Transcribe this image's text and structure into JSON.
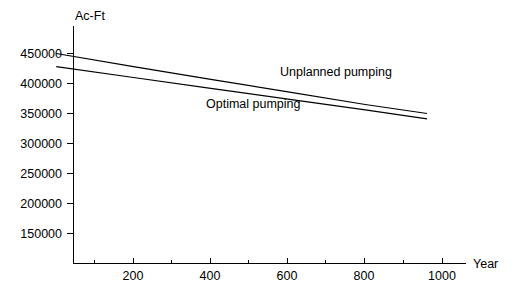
{
  "chart_data": {
    "type": "line",
    "title": "",
    "xlabel": "Year",
    "ylabel": "Ac-Ft",
    "xlim": [
      0,
      1080
    ],
    "ylim": [
      100000,
      460000
    ],
    "grid": false,
    "legend_position": "inline-annotation",
    "x_ticks": [
      200,
      400,
      600,
      800,
      1000
    ],
    "x_tick_labels": [
      "200",
      "400",
      "600",
      "800",
      "1000"
    ],
    "x_minor_ticks": [
      100,
      300,
      500,
      700,
      900
    ],
    "y_ticks": [
      150000,
      200000,
      250000,
      300000,
      350000,
      400000,
      450000
    ],
    "y_tick_labels": [
      "150000",
      "200000",
      "250000",
      "300000",
      "350000",
      "400000",
      "450000"
    ],
    "series": [
      {
        "name": "Unplanned pumping",
        "label": "Unplanned pumping",
        "x": [
          0,
          200,
          400,
          600,
          800,
          960
        ],
        "values": [
          450000,
          428000,
          407000,
          386000,
          365000,
          350000
        ]
      },
      {
        "name": "Optimal pumping",
        "label": "Optimal pumping",
        "x": [
          0,
          200,
          400,
          600,
          800,
          960
        ],
        "values": [
          428000,
          410000,
          392000,
          374000,
          356000,
          341000
        ]
      }
    ],
    "annotations": [
      {
        "text": "Unplanned pumping",
        "x": 600,
        "y": 398000
      },
      {
        "text": "Optimal pumping",
        "x": 405,
        "y": 318000
      }
    ]
  }
}
